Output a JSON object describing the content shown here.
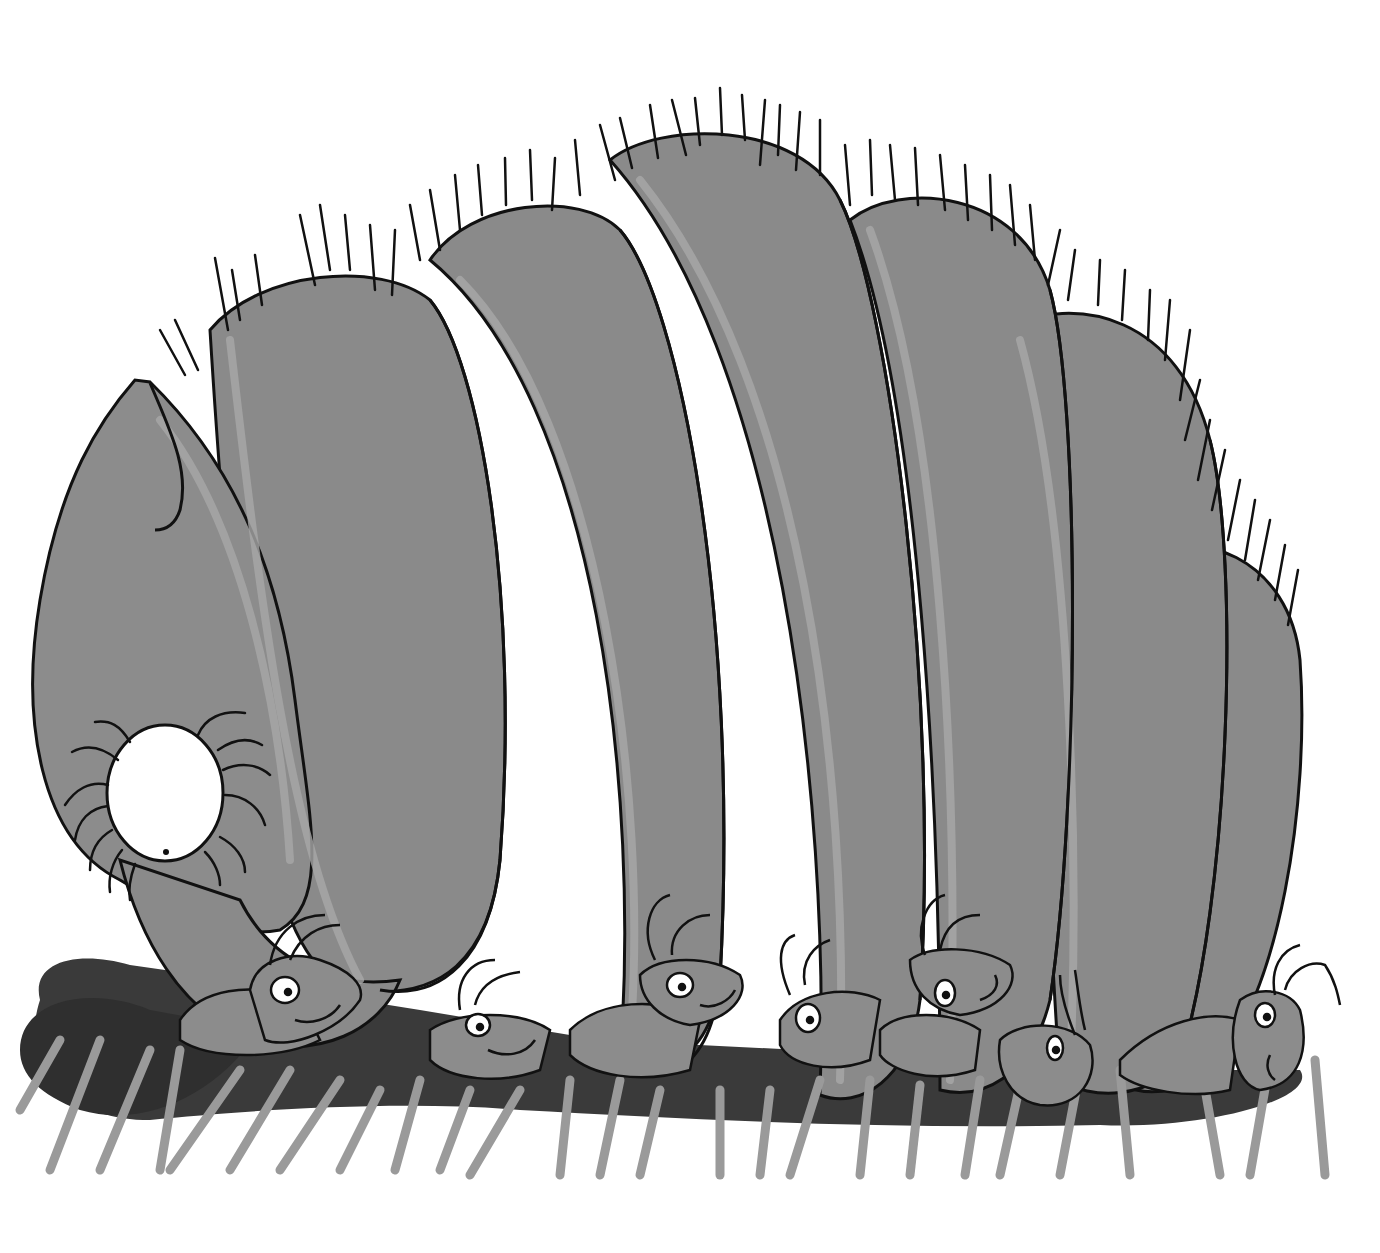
{
  "illustration": {
    "subject": "Cartoon ants carrying a giant hairy larva",
    "style": "greyscale ink and wash drawing",
    "colors": {
      "background": "#ffffff",
      "larva_body": "#8a8a8a",
      "larva_highlight": "#a2a2a2",
      "ink": "#111111",
      "ant_body": "#8c8c8c",
      "ant_shadow": "#3a3a3a",
      "ant_leg": "#9a9a9a",
      "eye_white": "#ffffff"
    },
    "larva": {
      "segments": 6,
      "head": "pointed head with hook mouthpart",
      "spiracle": "white round opening with curved hairs"
    },
    "ants": {
      "count": 7
    }
  }
}
